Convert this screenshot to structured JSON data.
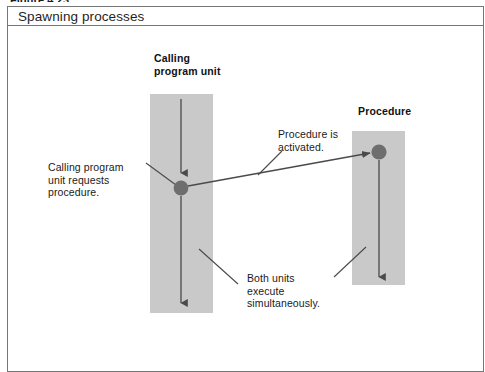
{
  "figure": {
    "caption_partial": "Figure 4.23",
    "title": "Spawning processes",
    "frame_color": "#767676"
  },
  "diagram": {
    "type": "flow-diagram",
    "bar_color": "#c9c9c9",
    "dot_color": "#6e6e6e",
    "line_color": "#4a4a4a",
    "units": [
      {
        "id": "calling-program-unit",
        "label": "Calling\nprogram unit",
        "bar": {
          "x": 150,
          "y": 94,
          "w": 63,
          "h": 219
        },
        "arrow_x": 181,
        "dot_y": 188
      },
      {
        "id": "procedure",
        "label": "Procedure",
        "bar": {
          "x": 352,
          "y": 131,
          "w": 53,
          "h": 154
        },
        "arrow_x": 379,
        "dot_y": 152
      }
    ],
    "annotations": [
      {
        "id": "calling-request",
        "text": "Calling program\nunit requests\nprocedure."
      },
      {
        "id": "procedure-activated",
        "text": "Procedure is\nactivated."
      },
      {
        "id": "both-units-execute",
        "text": "Both units\nexecute\nsimultaneously."
      }
    ]
  }
}
